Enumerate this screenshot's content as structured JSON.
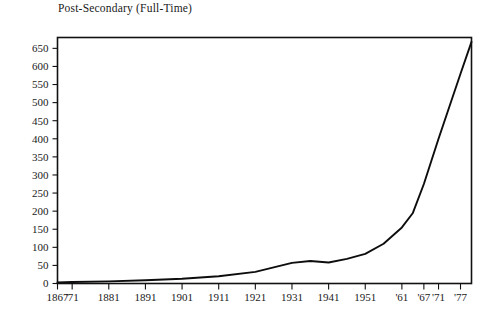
{
  "chart_data": {
    "type": "line",
    "title": "Post-Secondary (Full-Time)",
    "xlabel": "",
    "ylabel": "",
    "grid": false,
    "legend": "none",
    "xlim": [
      1867,
      1980
    ],
    "ylim": [
      0,
      680
    ],
    "yticks": [
      0,
      50,
      100,
      150,
      200,
      250,
      300,
      350,
      400,
      450,
      500,
      550,
      600,
      650
    ],
    "ytick_labels": [
      "0",
      "50",
      "100",
      "150",
      "200",
      "250",
      "300",
      "350",
      "400",
      "450",
      "500",
      "550",
      "600",
      "650"
    ],
    "xticks": [
      1867,
      1871,
      1881,
      1891,
      1901,
      1911,
      1921,
      1931,
      1941,
      1951,
      1961,
      1967,
      1971,
      1977
    ],
    "xtick_labels": [
      "1867",
      "'71",
      "1881",
      "1891",
      "1901",
      "1911",
      "1921",
      "1931",
      "1941",
      "1951",
      "'61",
      "'67",
      "'71",
      "'77"
    ],
    "series": [
      {
        "name": "Post-Secondary (Full-Time)",
        "color": "#0d0d0d",
        "x": [
          1867,
          1871,
          1881,
          1891,
          1901,
          1911,
          1921,
          1931,
          1936,
          1941,
          1946,
          1951,
          1956,
          1961,
          1964,
          1967,
          1971,
          1974,
          1977,
          1980
        ],
        "y": [
          3,
          4,
          6,
          9,
          13,
          20,
          32,
          57,
          62,
          58,
          68,
          82,
          110,
          155,
          195,
          275,
          400,
          490,
          580,
          668
        ]
      }
    ]
  },
  "axes": {
    "frame_color": "#111111",
    "tick_color": "#111111"
  }
}
